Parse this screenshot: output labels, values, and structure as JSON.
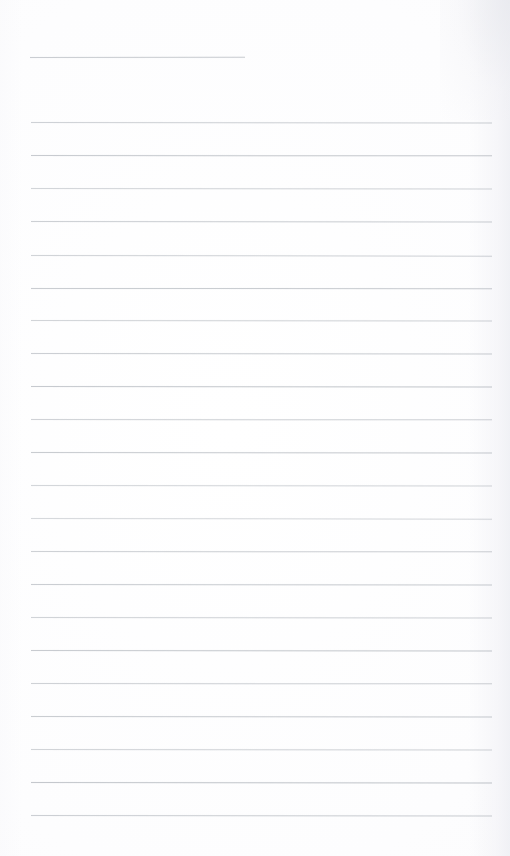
{
  "document": {
    "kind": "lined-paper-scan",
    "title": "Blank Lined Paper",
    "page_width": 510,
    "page_height": 856,
    "background_color": "#fefeff",
    "paper_tint": "#fdfdfe",
    "rule_color": "#9aa0a8",
    "has_visible_text": false,
    "has_handwriting": false,
    "has_margin_rule": false,
    "notes": "Empty ruled notebook page; no text, headings, or marks are present in the pixels."
  },
  "ruling": {
    "line_count": 23,
    "full_width_line_count": 22,
    "short_line_count": 1,
    "left_margin_x": 31,
    "right_margin_x": 492,
    "first_line_y": 57,
    "last_line_y": 815,
    "line_spacing": 33.1,
    "line_thickness": 1,
    "top_blank_margin": 57,
    "bottom_blank_margin": 41
  },
  "lines": [
    {
      "index": 1,
      "y": 57,
      "x1": 30,
      "x2": 245,
      "opacity": 0.52,
      "tilt": -0.05,
      "short": true
    },
    {
      "index": 2,
      "y": 122,
      "x1": 31,
      "x2": 492,
      "opacity": 0.48,
      "tilt": 0.06,
      "short": false
    },
    {
      "index": 3,
      "y": 155,
      "x1": 31,
      "x2": 492,
      "opacity": 0.55,
      "tilt": 0.04,
      "short": false
    },
    {
      "index": 4,
      "y": 188,
      "x1": 31,
      "x2": 492,
      "opacity": 0.44,
      "tilt": 0.07,
      "short": false
    },
    {
      "index": 5,
      "y": 221,
      "x1": 31,
      "x2": 492,
      "opacity": 0.5,
      "tilt": 0.05,
      "short": false
    },
    {
      "index": 6,
      "y": 255,
      "x1": 31,
      "x2": 492,
      "opacity": 0.46,
      "tilt": 0.08,
      "short": false
    },
    {
      "index": 7,
      "y": 288,
      "x1": 31,
      "x2": 492,
      "opacity": 0.53,
      "tilt": 0.03,
      "short": false
    },
    {
      "index": 8,
      "y": 320,
      "x1": 31,
      "x2": 492,
      "opacity": 0.45,
      "tilt": 0.06,
      "short": false
    },
    {
      "index": 9,
      "y": 353,
      "x1": 31,
      "x2": 492,
      "opacity": 0.51,
      "tilt": 0.05,
      "short": false
    },
    {
      "index": 10,
      "y": 386,
      "x1": 31,
      "x2": 492,
      "opacity": 0.56,
      "tilt": 0.07,
      "short": false
    },
    {
      "index": 11,
      "y": 419,
      "x1": 31,
      "x2": 492,
      "opacity": 0.47,
      "tilt": 0.04,
      "short": false
    },
    {
      "index": 12,
      "y": 452,
      "x1": 31,
      "x2": 492,
      "opacity": 0.54,
      "tilt": 0.06,
      "short": false
    },
    {
      "index": 13,
      "y": 485,
      "x1": 31,
      "x2": 492,
      "opacity": 0.43,
      "tilt": 0.05,
      "short": false
    },
    {
      "index": 14,
      "y": 518,
      "x1": 31,
      "x2": 492,
      "opacity": 0.4,
      "tilt": 0.08,
      "short": false
    },
    {
      "index": 15,
      "y": 551,
      "x1": 31,
      "x2": 492,
      "opacity": 0.49,
      "tilt": 0.04,
      "short": false
    },
    {
      "index": 16,
      "y": 584,
      "x1": 31,
      "x2": 492,
      "opacity": 0.52,
      "tilt": 0.06,
      "short": false
    },
    {
      "index": 17,
      "y": 617,
      "x1": 31,
      "x2": 492,
      "opacity": 0.46,
      "tilt": 0.05,
      "short": false
    },
    {
      "index": 18,
      "y": 650,
      "x1": 31,
      "x2": 492,
      "opacity": 0.55,
      "tilt": 0.07,
      "short": false
    },
    {
      "index": 19,
      "y": 683,
      "x1": 31,
      "x2": 492,
      "opacity": 0.48,
      "tilt": 0.04,
      "short": false
    },
    {
      "index": 20,
      "y": 716,
      "x1": 31,
      "x2": 492,
      "opacity": 0.53,
      "tilt": 0.06,
      "short": false
    },
    {
      "index": 21,
      "y": 749,
      "x1": 31,
      "x2": 492,
      "opacity": 0.45,
      "tilt": 0.05,
      "short": false
    },
    {
      "index": 22,
      "y": 782,
      "x1": 31,
      "x2": 492,
      "opacity": 0.58,
      "tilt": 0.07,
      "short": false
    },
    {
      "index": 23,
      "y": 815,
      "x1": 31,
      "x2": 492,
      "opacity": 0.5,
      "tilt": 0.05,
      "short": false
    }
  ]
}
